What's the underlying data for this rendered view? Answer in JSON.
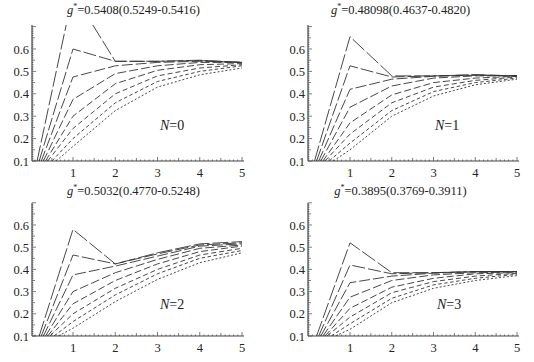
{
  "chart_data": [
    {
      "type": "line",
      "title": "g*=0.5408(0.5249-0.5416)",
      "title_value": "0.5408(0.5249-0.5416)",
      "annotation": "N=0",
      "annotation_value": "0",
      "xlim": [
        0,
        5
      ],
      "ylim": [
        0.1,
        0.7
      ],
      "xticks": [
        "1",
        "2",
        "3",
        "4",
        "5"
      ],
      "yticks": [
        "0.1",
        "0.2",
        "0.3",
        "0.4",
        "0.5",
        "0.6"
      ],
      "grid": false,
      "series": [
        {
          "name": "curve1",
          "dash": "16 3",
          "x": [
            0.15,
            1,
            2,
            3,
            4,
            5
          ],
          "y": [
            0.1,
            0.85,
            0.545,
            0.545,
            0.55,
            0.54
          ]
        },
        {
          "name": "curve2",
          "dash": "13 3",
          "x": [
            0.2,
            1,
            2,
            3,
            4,
            5
          ],
          "y": [
            0.1,
            0.6,
            0.545,
            0.545,
            0.548,
            0.54
          ]
        },
        {
          "name": "curve3",
          "dash": "11 3",
          "x": [
            0.25,
            1,
            2,
            3,
            4,
            5
          ],
          "y": [
            0.1,
            0.475,
            0.525,
            0.54,
            0.545,
            0.54
          ]
        },
        {
          "name": "curve4",
          "dash": "9 3",
          "x": [
            0.3,
            1,
            2,
            3,
            4,
            5
          ],
          "y": [
            0.1,
            0.375,
            0.49,
            0.525,
            0.54,
            0.54
          ]
        },
        {
          "name": "curve5",
          "dash": "7 3",
          "x": [
            0.35,
            1,
            2,
            3,
            4,
            5
          ],
          "y": [
            0.1,
            0.3,
            0.445,
            0.505,
            0.53,
            0.535
          ]
        },
        {
          "name": "curve6",
          "dash": "5 3",
          "x": [
            0.4,
            1,
            2,
            3,
            4,
            5
          ],
          "y": [
            0.1,
            0.245,
            0.4,
            0.48,
            0.515,
            0.53
          ]
        },
        {
          "name": "curve7",
          "dash": "3.5 2.5",
          "x": [
            0.5,
            1,
            2,
            3,
            4,
            5
          ],
          "y": [
            0.1,
            0.2,
            0.36,
            0.455,
            0.5,
            0.525
          ]
        },
        {
          "name": "curve8",
          "dash": "2 2",
          "x": [
            0.6,
            1,
            2,
            3,
            4,
            5
          ],
          "y": [
            0.1,
            0.165,
            0.325,
            0.43,
            0.485,
            0.515
          ]
        }
      ]
    },
    {
      "type": "line",
      "title": "g*=0.48098(0.4637-0.4820)",
      "title_value": "0.48098(0.4637-0.4820)",
      "annotation": "N=1",
      "annotation_value": "1",
      "xlim": [
        0,
        5
      ],
      "ylim": [
        0.1,
        0.7
      ],
      "xticks": [
        "1",
        "2",
        "3",
        "4",
        "5"
      ],
      "yticks": [
        "0.1",
        "0.2",
        "0.3",
        "0.4",
        "0.5",
        "0.6"
      ],
      "grid": false,
      "series": [
        {
          "name": "curve1",
          "dash": "16 3",
          "x": [
            0.15,
            1,
            2,
            3,
            4,
            5
          ],
          "y": [
            0.1,
            0.655,
            0.48,
            0.48,
            0.485,
            0.48
          ]
        },
        {
          "name": "curve2",
          "dash": "13 3",
          "x": [
            0.2,
            1,
            2,
            3,
            4,
            5
          ],
          "y": [
            0.1,
            0.525,
            0.475,
            0.48,
            0.485,
            0.48
          ]
        },
        {
          "name": "curve3",
          "dash": "11 3",
          "x": [
            0.25,
            1,
            2,
            3,
            4,
            5
          ],
          "y": [
            0.1,
            0.42,
            0.465,
            0.478,
            0.483,
            0.48
          ]
        },
        {
          "name": "curve4",
          "dash": "9 3",
          "x": [
            0.3,
            1,
            2,
            3,
            4,
            5
          ],
          "y": [
            0.1,
            0.34,
            0.435,
            0.47,
            0.48,
            0.48
          ]
        },
        {
          "name": "curve5",
          "dash": "7 3",
          "x": [
            0.35,
            1,
            2,
            3,
            4,
            5
          ],
          "y": [
            0.1,
            0.27,
            0.395,
            0.45,
            0.47,
            0.478
          ]
        },
        {
          "name": "curve6",
          "dash": "5 3",
          "x": [
            0.4,
            1,
            2,
            3,
            4,
            5
          ],
          "y": [
            0.1,
            0.22,
            0.36,
            0.43,
            0.46,
            0.475
          ]
        },
        {
          "name": "curve7",
          "dash": "3.5 2.5",
          "x": [
            0.5,
            1,
            2,
            3,
            4,
            5
          ],
          "y": [
            0.1,
            0.18,
            0.325,
            0.41,
            0.45,
            0.47
          ]
        },
        {
          "name": "curve8",
          "dash": "2 2",
          "x": [
            0.6,
            1,
            2,
            3,
            4,
            5
          ],
          "y": [
            0.1,
            0.15,
            0.3,
            0.39,
            0.44,
            0.465
          ]
        }
      ]
    },
    {
      "type": "line",
      "title": "g*=0.5032(0.4770-0.5248)",
      "title_value": "0.5032(0.4770-0.5248)",
      "annotation": "N=2",
      "annotation_value": "2",
      "xlim": [
        0,
        5
      ],
      "ylim": [
        0.1,
        0.7
      ],
      "xticks": [
        "1",
        "2",
        "3",
        "4",
        "5"
      ],
      "yticks": [
        "0.1",
        "0.2",
        "0.3",
        "0.4",
        "0.5",
        "0.6"
      ],
      "grid": false,
      "series": [
        {
          "name": "curve1",
          "dash": "16 3",
          "x": [
            0.2,
            1,
            2,
            3,
            4,
            5
          ],
          "y": [
            0.1,
            0.58,
            0.425,
            0.475,
            0.515,
            0.525
          ]
        },
        {
          "name": "curve2",
          "dash": "13 3",
          "x": [
            0.25,
            1,
            2,
            3,
            4,
            5
          ],
          "y": [
            0.1,
            0.465,
            0.425,
            0.47,
            0.51,
            0.52
          ]
        },
        {
          "name": "curve3",
          "dash": "11 3",
          "x": [
            0.3,
            1,
            2,
            3,
            4,
            5
          ],
          "y": [
            0.1,
            0.375,
            0.415,
            0.46,
            0.505,
            0.515
          ]
        },
        {
          "name": "curve4",
          "dash": "9 3",
          "x": [
            0.35,
            1,
            2,
            3,
            4,
            5
          ],
          "y": [
            0.1,
            0.3,
            0.385,
            0.445,
            0.495,
            0.51
          ]
        },
        {
          "name": "curve5",
          "dash": "7 3",
          "x": [
            0.4,
            1,
            2,
            3,
            4,
            5
          ],
          "y": [
            0.1,
            0.245,
            0.35,
            0.425,
            0.48,
            0.505
          ]
        },
        {
          "name": "curve6",
          "dash": "5 3",
          "x": [
            0.45,
            1,
            2,
            3,
            4,
            5
          ],
          "y": [
            0.1,
            0.2,
            0.315,
            0.4,
            0.465,
            0.495
          ]
        },
        {
          "name": "curve7",
          "dash": "3.5 2.5",
          "x": [
            0.55,
            1,
            2,
            3,
            4,
            5
          ],
          "y": [
            0.1,
            0.165,
            0.285,
            0.38,
            0.45,
            0.485
          ]
        },
        {
          "name": "curve8",
          "dash": "2 2",
          "x": [
            0.65,
            1,
            2,
            3,
            4,
            5
          ],
          "y": [
            0.1,
            0.135,
            0.255,
            0.355,
            0.43,
            0.475
          ]
        }
      ]
    },
    {
      "type": "line",
      "title": "g*=0.3895(0.3769-0.3911)",
      "title_value": "0.3895(0.3769-0.3911)",
      "annotation": "N=3",
      "annotation_value": "3",
      "xlim": [
        0,
        5
      ],
      "ylim": [
        0.1,
        0.7
      ],
      "xticks": [
        "1",
        "2",
        "3",
        "4",
        "5"
      ],
      "yticks": [
        "0.1",
        "0.2",
        "0.3",
        "0.4",
        "0.5",
        "0.6"
      ],
      "grid": false,
      "series": [
        {
          "name": "curve1",
          "dash": "16 3",
          "x": [
            0.2,
            1,
            2,
            3,
            4,
            5
          ],
          "y": [
            0.1,
            0.52,
            0.385,
            0.385,
            0.39,
            0.39
          ]
        },
        {
          "name": "curve2",
          "dash": "13 3",
          "x": [
            0.25,
            1,
            2,
            3,
            4,
            5
          ],
          "y": [
            0.1,
            0.42,
            0.38,
            0.385,
            0.39,
            0.39
          ]
        },
        {
          "name": "curve3",
          "dash": "11 3",
          "x": [
            0.3,
            1,
            2,
            3,
            4,
            5
          ],
          "y": [
            0.1,
            0.34,
            0.37,
            0.383,
            0.389,
            0.39
          ]
        },
        {
          "name": "curve4",
          "dash": "9 3",
          "x": [
            0.35,
            1,
            2,
            3,
            4,
            5
          ],
          "y": [
            0.1,
            0.275,
            0.35,
            0.375,
            0.385,
            0.388
          ]
        },
        {
          "name": "curve5",
          "dash": "7 3",
          "x": [
            0.4,
            1,
            2,
            3,
            4,
            5
          ],
          "y": [
            0.1,
            0.225,
            0.32,
            0.36,
            0.38,
            0.385
          ]
        },
        {
          "name": "curve6",
          "dash": "5 3",
          "x": [
            0.45,
            1,
            2,
            3,
            4,
            5
          ],
          "y": [
            0.1,
            0.185,
            0.295,
            0.345,
            0.37,
            0.382
          ]
        },
        {
          "name": "curve7",
          "dash": "3.5 2.5",
          "x": [
            0.55,
            1,
            2,
            3,
            4,
            5
          ],
          "y": [
            0.1,
            0.155,
            0.27,
            0.33,
            0.36,
            0.378
          ]
        },
        {
          "name": "curve8",
          "dash": "2 2",
          "x": [
            0.65,
            1,
            2,
            3,
            4,
            5
          ],
          "y": [
            0.1,
            0.13,
            0.25,
            0.315,
            0.35,
            0.372
          ]
        }
      ]
    }
  ],
  "panels": [
    {
      "title_prefix": "g",
      "title_sup": "*",
      "title_eq": "=",
      "title_value": "0.5408(0.5249-0.5416)",
      "n_label": "N",
      "n_eq": "=",
      "n_value": "0"
    },
    {
      "title_prefix": "g",
      "title_sup": "*",
      "title_eq": "=",
      "title_value": "0.48098(0.4637-0.4820)",
      "n_label": "N",
      "n_eq": "=",
      "n_value": "1"
    },
    {
      "title_prefix": "g",
      "title_sup": "*",
      "title_eq": "=",
      "title_value": "0.5032(0.4770-0.5248)",
      "n_label": "N",
      "n_eq": "=",
      "n_value": "2"
    },
    {
      "title_prefix": "g",
      "title_sup": "*",
      "title_eq": "=",
      "title_value": "0.3895(0.3769-0.3911)",
      "n_label": "N",
      "n_eq": "=",
      "n_value": "3"
    }
  ],
  "colors": {
    "line": "#333333",
    "axis": "#444444",
    "background": "#ffffff"
  }
}
